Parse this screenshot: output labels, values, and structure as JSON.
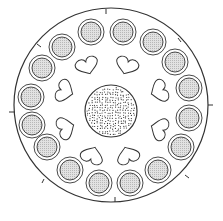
{
  "diagram": {
    "type": "circular-pattern",
    "colors": {
      "stroke": "#333333",
      "pad_fill": "#d4d4d4",
      "background": "#ffffff",
      "dots": "#333333"
    },
    "outer_circle": {
      "cx": 111,
      "cy": 105,
      "r": 97
    },
    "ticks": [
      {
        "x1": 106,
        "y1": 9,
        "x2": 106,
        "y2": 14
      },
      {
        "x1": 9,
        "y1": 112,
        "x2": 15,
        "y2": 112
      },
      {
        "x1": 208,
        "y1": 105,
        "x2": 213,
        "y2": 105
      },
      {
        "x1": 115,
        "y1": 202,
        "x2": 115,
        "y2": 197
      },
      {
        "x1": 37,
        "y1": 44,
        "x2": 41,
        "y2": 47
      },
      {
        "x1": 178,
        "y1": 38,
        "x2": 181,
        "y2": 42
      },
      {
        "x1": 185,
        "y1": 175,
        "x2": 189,
        "y2": 178
      },
      {
        "x1": 44,
        "y1": 179,
        "x2": 42,
        "y2": 183
      }
    ],
    "pads": [
      {
        "cx": 91,
        "cy": 32
      },
      {
        "cx": 123,
        "cy": 32
      },
      {
        "cx": 153,
        "cy": 42
      },
      {
        "cx": 175,
        "cy": 62
      },
      {
        "cx": 189,
        "cy": 88
      },
      {
        "cx": 189,
        "cy": 118
      },
      {
        "cx": 181,
        "cy": 147
      },
      {
        "cx": 158,
        "cy": 170
      },
      {
        "cx": 130,
        "cy": 183
      },
      {
        "cx": 99,
        "cy": 183
      },
      {
        "cx": 70,
        "cy": 170
      },
      {
        "cx": 47,
        "cy": 147
      },
      {
        "cx": 32,
        "cy": 125
      },
      {
        "cx": 31,
        "cy": 97
      },
      {
        "cx": 42,
        "cy": 68
      },
      {
        "cx": 62,
        "cy": 47
      }
    ],
    "pad_radii": {
      "outer": 13,
      "inner": 10
    },
    "hearts": [
      {
        "cx": 88,
        "cy": 68,
        "rot": -20
      },
      {
        "cx": 126,
        "cy": 68,
        "rot": 20
      },
      {
        "cx": 157,
        "cy": 92,
        "rot": 70
      },
      {
        "cx": 157,
        "cy": 128,
        "rot": 110
      },
      {
        "cx": 127,
        "cy": 153,
        "rot": 160
      },
      {
        "cx": 93,
        "cy": 153,
        "rot": 200
      },
      {
        "cx": 68,
        "cy": 127,
        "rot": 250
      },
      {
        "cx": 67,
        "cy": 92,
        "rot": 290
      }
    ],
    "center_disc": {
      "cx": 111,
      "cy": 111,
      "r": 26
    }
  }
}
